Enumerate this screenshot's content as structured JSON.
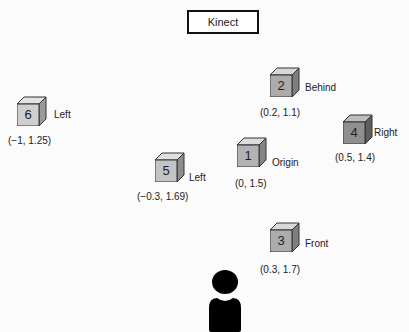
{
  "title": "Kinect",
  "cubes": [
    {
      "id": "1",
      "name": "Origin",
      "coord": "(0, 1.5)",
      "color": "#b3b3b3"
    },
    {
      "id": "2",
      "name": "Behind",
      "coord": "(0.2, 1.1)",
      "color": "#acacac"
    },
    {
      "id": "3",
      "name": "Front",
      "coord": "(0.3, 1.7)",
      "color": "#acacac"
    },
    {
      "id": "4",
      "name": "Right",
      "coord": "(0.5, 1.4)",
      "color": "#8f8f8f"
    },
    {
      "id": "5",
      "name": "Left",
      "coord": "(−0.3, 1.69)",
      "color": "#c4c4c4"
    },
    {
      "id": "6",
      "name": "Left",
      "coord": "(−1, 1.25)",
      "color": "#cfcfcf"
    }
  ],
  "person": {
    "icon": "user-icon"
  }
}
